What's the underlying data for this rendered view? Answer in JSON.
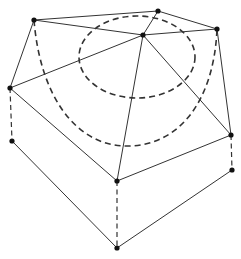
{
  "diagram": {
    "type": "wireframe-pentagonal-dome-over-prism",
    "colors": {
      "line": "#333333",
      "node": "#111111",
      "background": "#ffffff"
    },
    "nodes": [
      {
        "id": "A",
        "x": 34,
        "y": 20
      },
      {
        "id": "B",
        "x": 158,
        "y": 11
      },
      {
        "id": "C",
        "x": 143,
        "y": 35
      },
      {
        "id": "D",
        "x": 217,
        "y": 29
      },
      {
        "id": "E",
        "x": 10,
        "y": 88
      },
      {
        "id": "F",
        "x": 12,
        "y": 141
      },
      {
        "id": "G",
        "x": 117,
        "y": 181
      },
      {
        "id": "H",
        "x": 231,
        "y": 135
      },
      {
        "id": "I",
        "x": 232,
        "y": 170
      },
      {
        "id": "J",
        "x": 117,
        "y": 248
      }
    ],
    "solid_edges": [
      [
        "A",
        "B"
      ],
      [
        "A",
        "C"
      ],
      [
        "B",
        "C"
      ],
      [
        "B",
        "D"
      ],
      [
        "C",
        "D"
      ],
      [
        "A",
        "E"
      ],
      [
        "E",
        "C"
      ],
      [
        "E",
        "G"
      ],
      [
        "C",
        "G"
      ],
      [
        "C",
        "H"
      ],
      [
        "D",
        "H"
      ],
      [
        "G",
        "H"
      ],
      [
        "F",
        "J"
      ],
      [
        "J",
        "I"
      ]
    ],
    "dashed_edges": [
      [
        "E",
        "F"
      ],
      [
        "H",
        "I"
      ],
      [
        "G",
        "J"
      ]
    ],
    "dashed_curves": [
      {
        "name": "inner-ellipse",
        "cx": 137,
        "cy": 57,
        "rx": 58,
        "ry": 41
      },
      {
        "name": "outer-arc",
        "from": "A",
        "to": "D",
        "through": [
          125,
          146
        ]
      }
    ]
  }
}
